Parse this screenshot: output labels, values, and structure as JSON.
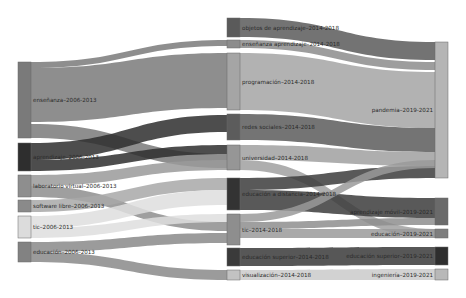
{
  "diagram": {
    "type": "sankey",
    "columns": [
      {
        "period": "2006-2013"
      },
      {
        "period": "2014-2018"
      },
      {
        "period": "2019-2021"
      }
    ],
    "nodes": [
      {
        "id": "c1_ensenanza",
        "label": "enseñanza–2006-2013",
        "col": 0,
        "x": 18,
        "y0": 62,
        "y1": 138,
        "color": "#7a7a7a"
      },
      {
        "id": "c1_dark",
        "label": "aprendizaje–2006-2013",
        "col": 0,
        "x": 18,
        "y0": 143,
        "y1": 171,
        "color": "#2e2e2e"
      },
      {
        "id": "c1_labvirtual",
        "label": "laboratorio virtual–2006-2013",
        "col": 0,
        "x": 18,
        "y0": 175,
        "y1": 197,
        "color": "#8e8e8e"
      },
      {
        "id": "c1_softlibre",
        "label": "software libre–2006-2013",
        "col": 0,
        "x": 18,
        "y0": 200,
        "y1": 212,
        "color": "#8a8a8a"
      },
      {
        "id": "c1_tic",
        "label": "tic–2006-2013",
        "col": 0,
        "x": 18,
        "y0": 216,
        "y1": 238,
        "color": "#dcdcdc"
      },
      {
        "id": "c1_educacion",
        "label": "educación–2006-2013",
        "col": 0,
        "x": 18,
        "y0": 242,
        "y1": 262,
        "color": "#828282"
      },
      {
        "id": "c2_objetos",
        "label": "objetos de aprendizaje–2014-2018",
        "col": 1,
        "x": 227,
        "y0": 18,
        "y1": 37,
        "color": "#5a5a5a"
      },
      {
        "id": "c2_ensapr",
        "label": "enseñanza aprendizaje–2014-2018",
        "col": 1,
        "x": 227,
        "y0": 40,
        "y1": 48,
        "color": "#8c8c8c"
      },
      {
        "id": "c2_programacion",
        "label": "programación–2014-2018",
        "col": 1,
        "x": 227,
        "y0": 53,
        "y1": 110,
        "color": "#a5a5a5"
      },
      {
        "id": "c2_redes",
        "label": "redes sociales–2014-2018",
        "col": 1,
        "x": 227,
        "y0": 114,
        "y1": 140,
        "color": "#5c5c5c"
      },
      {
        "id": "c2_universidad",
        "label": "universidad–2014-2018",
        "col": 1,
        "x": 227,
        "y0": 145,
        "y1": 170,
        "color": "#969696"
      },
      {
        "id": "c2_edudist",
        "label": "educación a distancia–2014-2018",
        "col": 1,
        "x": 227,
        "y0": 178,
        "y1": 210,
        "color": "#333333"
      },
      {
        "id": "c2_tic",
        "label": "tic–2014-2018",
        "col": 1,
        "x": 227,
        "y0": 214,
        "y1": 245,
        "color": "#8e8e8e"
      },
      {
        "id": "c2_edusup",
        "label": "educación superior–2014-2018",
        "col": 1,
        "x": 227,
        "y0": 248,
        "y1": 266,
        "color": "#3a3a3a"
      },
      {
        "id": "c2_visual",
        "label": "visualización–2014-2018",
        "col": 1,
        "x": 227,
        "y0": 270,
        "y1": 280,
        "color": "#c2c2c2"
      },
      {
        "id": "c3_pandemia",
        "label": "pandemia–2019-2021",
        "col": 2,
        "x": 435,
        "y0": 42,
        "y1": 178,
        "color": "#b5b5b5"
      },
      {
        "id": "c3_aprmovil",
        "label": "aprendizaje móvil–2019-2021",
        "col": 2,
        "x": 435,
        "y0": 198,
        "y1": 225,
        "color": "#6a6a6a"
      },
      {
        "id": "c3_educacion",
        "label": "educación–2019-2021",
        "col": 2,
        "x": 435,
        "y0": 229,
        "y1": 238,
        "color": "#7e7e7e"
      },
      {
        "id": "c3_edusup",
        "label": "educación superior–2019-2021",
        "col": 2,
        "x": 435,
        "y0": 247,
        "y1": 265,
        "color": "#2e2e2e"
      },
      {
        "id": "c3_ingenieria",
        "label": "ingeniería–2019-2021",
        "col": 2,
        "x": 435,
        "y0": 269,
        "y1": 280,
        "color": "#b8b8b8"
      }
    ],
    "links": [
      {
        "source": "c1_ensenanza",
        "target": "c2_ensapr",
        "sy0": 62,
        "sy1": 68,
        "ty0": 40,
        "ty1": 46,
        "color": "#7a7a7a"
      },
      {
        "source": "c1_ensenanza",
        "target": "c2_programacion",
        "sy0": 68,
        "sy1": 122,
        "ty0": 53,
        "ty1": 108,
        "color": "#7a7a7a"
      },
      {
        "source": "c1_ensenanza",
        "target": "c2_universidad",
        "sy0": 124,
        "sy1": 138,
        "ty0": 154,
        "ty1": 168,
        "color": "#7a7a7a"
      },
      {
        "source": "c1_dark",
        "target": "c2_redes",
        "sy0": 143,
        "sy1": 160,
        "ty0": 115,
        "ty1": 132,
        "color": "#2e2e2e"
      },
      {
        "source": "c1_dark",
        "target": "c2_universidad",
        "sy0": 160,
        "sy1": 171,
        "ty0": 145,
        "ty1": 154,
        "color": "#2e2e2e"
      },
      {
        "source": "c1_labvirtual",
        "target": "c2_universidad",
        "sy0": 175,
        "sy1": 186,
        "ty0": 160,
        "ty1": 170,
        "color": "#9a9a9a"
      },
      {
        "source": "c1_labvirtual",
        "target": "c2_tic",
        "sy0": 186,
        "sy1": 197,
        "ty0": 222,
        "ty1": 231,
        "color": "#8e8e8e"
      },
      {
        "source": "c1_softlibre",
        "target": "c2_edudist",
        "sy0": 200,
        "sy1": 212,
        "ty0": 178,
        "ty1": 190,
        "color": "#a8a8a8"
      },
      {
        "source": "c1_tic",
        "target": "c2_edudist",
        "sy0": 216,
        "sy1": 228,
        "ty0": 190,
        "ty1": 205,
        "color": "#dedede"
      },
      {
        "source": "c1_tic",
        "target": "c2_tic",
        "sy0": 228,
        "sy1": 238,
        "ty0": 214,
        "ty1": 222,
        "color": "#dedede"
      },
      {
        "source": "c1_educacion",
        "target": "c2_tic",
        "sy0": 242,
        "sy1": 252,
        "ty0": 233,
        "ty1": 243,
        "color": "#8a8a8a"
      },
      {
        "source": "c1_educacion",
        "target": "c2_visual",
        "sy0": 252,
        "sy1": 262,
        "ty0": 270,
        "ty1": 280,
        "color": "#8a8a8a"
      },
      {
        "source": "c2_objetos",
        "target": "c3_pandemia",
        "sy0": 18,
        "sy1": 37,
        "ty0": 42,
        "ty1": 60,
        "color": "#5a5a5a"
      },
      {
        "source": "c2_ensapr",
        "target": "c3_pandemia",
        "sy0": 40,
        "sy1": 48,
        "ty0": 62,
        "ty1": 70,
        "color": "#8c8c8c"
      },
      {
        "source": "c2_programacion",
        "target": "c3_pandemia",
        "sy0": 53,
        "sy1": 110,
        "ty0": 72,
        "ty1": 128,
        "color": "#a5a5a5"
      },
      {
        "source": "c2_redes",
        "target": "c3_pandemia",
        "sy0": 114,
        "sy1": 140,
        "ty0": 128,
        "ty1": 152,
        "color": "#5c5c5c"
      },
      {
        "source": "c2_universidad",
        "target": "c3_pandemia",
        "sy0": 145,
        "sy1": 160,
        "ty0": 152,
        "ty1": 166,
        "color": "#a0a0a0"
      },
      {
        "source": "c2_universidad",
        "target": "c3_educacion",
        "sy0": 160,
        "sy1": 170,
        "ty0": 229,
        "ty1": 238,
        "color": "#a0a0a0"
      },
      {
        "source": "c2_edudist",
        "target": "c3_pandemia",
        "sy0": 178,
        "sy1": 190,
        "ty0": 166,
        "ty1": 178,
        "color": "#3c3c3c"
      },
      {
        "source": "c2_edudist",
        "target": "c3_aprmovil",
        "sy0": 190,
        "sy1": 210,
        "ty0": 198,
        "ty1": 218,
        "color": "#3c3c3c"
      },
      {
        "source": "c2_tic",
        "target": "c3_pandemia",
        "sy0": 214,
        "sy1": 222,
        "ty0": 160,
        "ty1": 168,
        "color": "#9a9a9a"
      },
      {
        "source": "c2_tic",
        "target": "c3_aprmovil",
        "sy0": 222,
        "sy1": 229,
        "ty0": 218,
        "ty1": 225,
        "color": "#8e8e8e"
      },
      {
        "source": "c2_tic",
        "target": "c3_educacion",
        "sy0": 229,
        "sy1": 238,
        "ty0": 229,
        "ty1": 238,
        "color": "#9a9a9a"
      },
      {
        "source": "c2_edusup",
        "target": "c3_edusup",
        "sy0": 248,
        "sy1": 266,
        "ty0": 247,
        "ty1": 265,
        "color": "#3a3a3a"
      },
      {
        "source": "c2_visual",
        "target": "c3_ingenieria",
        "sy0": 270,
        "sy1": 280,
        "ty0": 269,
        "ty1": 280,
        "color": "#cacaca"
      }
    ],
    "layout": {
      "node_width": 13,
      "link_opacity": 0.85,
      "label_color": "#2a2a2a"
    }
  }
}
